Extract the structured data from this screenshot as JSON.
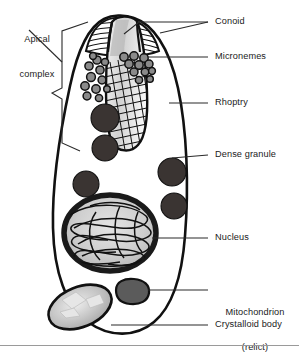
{
  "figure": {
    "kind": "biology-cell-diagram",
    "background_color": "#ffffff",
    "outline_color": "#111111",
    "dense_color": "#3a3432",
    "mid_gray": "#6f6f6f",
    "light_gray": "#c9c9c9"
  },
  "labels": {
    "apical_complex_line1": "Apical",
    "apical_complex_line2": "complex",
    "conoid": "Conoid",
    "micronemes": "Micronemes",
    "rhoptry": "Rhoptry",
    "dense_granule": "Dense granule",
    "nucleus": "Nucleus",
    "mitochondrion_line1": "Mitochondrion",
    "mitochondrion_line2": "(relict)",
    "crystalloid_body": "Crystalloid body"
  },
  "structures": [
    {
      "name": "cell-membrane",
      "label": null
    },
    {
      "name": "conoid",
      "label": "Conoid"
    },
    {
      "name": "micronemes",
      "label": "Micronemes"
    },
    {
      "name": "rhoptry",
      "label": "Rhoptry"
    },
    {
      "name": "dense-granule",
      "label": "Dense granule"
    },
    {
      "name": "nucleus",
      "label": "Nucleus"
    },
    {
      "name": "mitochondrion",
      "label": "Mitochondrion (relict)"
    },
    {
      "name": "crystalloid-body",
      "label": "Crystalloid body"
    },
    {
      "name": "apical-complex-bracket",
      "label": "Apical complex"
    }
  ]
}
